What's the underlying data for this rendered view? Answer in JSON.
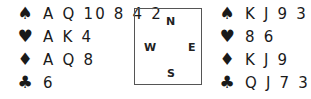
{
  "west": {
    "spades": "A Q 10 8 4 2",
    "hearts": "A K 4",
    "diamonds": "A Q 8",
    "clubs": "6"
  },
  "east": {
    "spades": "K J 9 3",
    "hearts": "8 6",
    "diamonds": "K J 9",
    "clubs": "Q J 7 3"
  },
  "compass": {
    "north": "N",
    "south": "S",
    "west": "W",
    "east": "E"
  },
  "suit_symbols": {
    "spades": "♠",
    "hearts": "♥",
    "diamonds": "♦",
    "clubs": "♣"
  }
}
